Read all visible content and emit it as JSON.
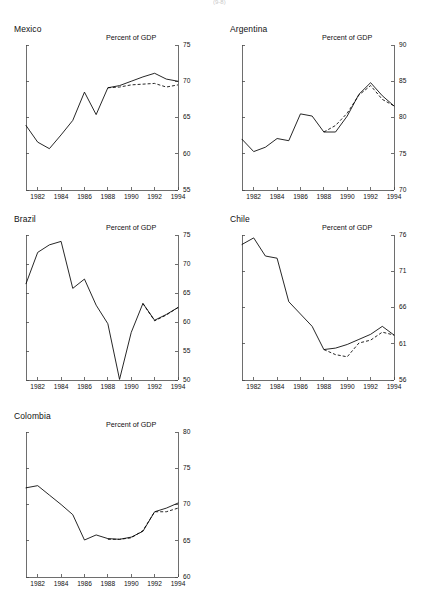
{
  "figure": {
    "top_artifact": "(9-8)",
    "units_label": "Percent of GDP",
    "background_color": "#ffffff",
    "line_color": "#000000",
    "axis_color": "#4a4a4a"
  },
  "panels": [
    {
      "key": "mexico",
      "title": "Mexico",
      "units_label": "Percent of GDP",
      "position": {
        "left": 6,
        "top": 24,
        "width": 204,
        "height": 186
      },
      "plot": {
        "left": 20,
        "top": 21,
        "right": 172,
        "bottom": 166
      }
    },
    {
      "key": "argentina",
      "title": "Argentina",
      "units_label": "Percent of GDP",
      "position": {
        "left": 222,
        "top": 24,
        "width": 204,
        "height": 186
      },
      "plot": {
        "left": 20,
        "top": 21,
        "right": 172,
        "bottom": 166
      }
    },
    {
      "key": "brazil",
      "title": "Brazil",
      "units_label": "Percent of GDP",
      "position": {
        "left": 6,
        "top": 214,
        "width": 204,
        "height": 186
      },
      "plot": {
        "left": 20,
        "top": 21,
        "right": 172,
        "bottom": 166
      }
    },
    {
      "key": "chile",
      "title": "Chile",
      "units_label": "Percent of GDP",
      "position": {
        "left": 222,
        "top": 214,
        "width": 204,
        "height": 186
      },
      "plot": {
        "left": 20,
        "top": 21,
        "right": 172,
        "bottom": 166
      }
    },
    {
      "key": "colombia",
      "title": "Colombia",
      "units_label": "Percent of GDP",
      "position": {
        "left": 6,
        "top": 411,
        "width": 204,
        "height": 186
      },
      "plot": {
        "left": 20,
        "top": 21,
        "right": 172,
        "bottom": 166
      }
    }
  ],
  "chart_data": [
    {
      "key": "mexico",
      "type": "line",
      "title": "Mexico",
      "xlabel": "",
      "ylabel": "Percent of GDP",
      "xlim": [
        1981,
        1994
      ],
      "ylim": [
        55,
        75
      ],
      "yticks": [
        55,
        60,
        65,
        70,
        75
      ],
      "xticks": [
        1982,
        1984,
        1986,
        1988,
        1990,
        1992,
        1994
      ],
      "grid": false,
      "legend": "none",
      "x": [
        1981,
        1982,
        1983,
        1984,
        1985,
        1986,
        1987,
        1988,
        1989,
        1990,
        1991,
        1992,
        1993,
        1994
      ],
      "series": [
        {
          "name": "solid",
          "style": "solid",
          "values": [
            63.9,
            61.6,
            60.7,
            62.6,
            64.6,
            68.5,
            65.4,
            69.1,
            69.4,
            70.0,
            70.6,
            71.1,
            70.3,
            70.0
          ]
        },
        {
          "name": "dashed",
          "style": "dashed",
          "values": [
            null,
            null,
            null,
            null,
            null,
            null,
            null,
            69.1,
            69.2,
            69.5,
            69.6,
            69.7,
            69.2,
            69.5
          ]
        }
      ]
    },
    {
      "key": "argentina",
      "type": "line",
      "title": "Argentina",
      "xlabel": "",
      "ylabel": "Percent of GDP",
      "xlim": [
        1981,
        1994
      ],
      "ylim": [
        70,
        90
      ],
      "yticks": [
        70,
        75,
        80,
        85,
        90
      ],
      "xticks": [
        1982,
        1984,
        1986,
        1988,
        1990,
        1992,
        1994
      ],
      "grid": false,
      "legend": "none",
      "x": [
        1981,
        1982,
        1983,
        1984,
        1985,
        1986,
        1987,
        1988,
        1989,
        1990,
        1991,
        1992,
        1993,
        1994
      ],
      "series": [
        {
          "name": "solid",
          "style": "solid",
          "values": [
            77.0,
            75.3,
            75.9,
            77.1,
            76.8,
            80.5,
            80.2,
            78.0,
            78.0,
            80.2,
            83.2,
            84.8,
            83.0,
            81.6
          ]
        },
        {
          "name": "dashed",
          "style": "dashed",
          "values": [
            null,
            null,
            null,
            null,
            null,
            null,
            null,
            78.0,
            78.9,
            80.6,
            83.1,
            84.4,
            82.5,
            81.6
          ]
        }
      ]
    },
    {
      "key": "brazil",
      "type": "line",
      "title": "Brazil",
      "xlabel": "",
      "ylabel": "Percent of GDP",
      "xlim": [
        1981,
        1994
      ],
      "ylim": [
        50,
        75
      ],
      "yticks": [
        50,
        55,
        60,
        65,
        70,
        75
      ],
      "xticks": [
        1982,
        1984,
        1986,
        1988,
        1990,
        1992,
        1994
      ],
      "grid": false,
      "legend": "none",
      "x": [
        1981,
        1982,
        1983,
        1984,
        1985,
        1986,
        1987,
        1988,
        1989,
        1990,
        1991,
        1992,
        1993,
        1994
      ],
      "series": [
        {
          "name": "solid",
          "style": "solid",
          "values": [
            66.6,
            72.0,
            73.3,
            73.9,
            65.8,
            67.4,
            62.9,
            59.7,
            50.1,
            58.2,
            63.2,
            60.3,
            61.3,
            62.5
          ]
        },
        {
          "name": "dashed",
          "style": "dashed",
          "values": [
            null,
            null,
            null,
            null,
            null,
            null,
            null,
            null,
            null,
            null,
            63.2,
            60.2,
            61.2,
            62.5
          ]
        }
      ]
    },
    {
      "key": "chile",
      "type": "line",
      "title": "Chile",
      "xlabel": "",
      "ylabel": "Percent of GDP",
      "xlim": [
        1981,
        1994
      ],
      "ylim": [
        56,
        76
      ],
      "yticks": [
        56,
        61,
        66,
        71,
        76
      ],
      "xticks": [
        1982,
        1984,
        1986,
        1988,
        1990,
        1992,
        1994
      ],
      "grid": false,
      "legend": "none",
      "x": [
        1981,
        1982,
        1983,
        1984,
        1985,
        1986,
        1987,
        1988,
        1989,
        1990,
        1991,
        1992,
        1993,
        1994
      ],
      "series": [
        {
          "name": "solid",
          "style": "solid",
          "values": [
            74.7,
            75.6,
            73.1,
            72.8,
            66.8,
            65.1,
            63.4,
            60.2,
            60.4,
            60.9,
            61.6,
            62.3,
            63.4,
            62.2
          ]
        },
        {
          "name": "dashed",
          "style": "dashed",
          "values": [
            null,
            null,
            null,
            null,
            null,
            null,
            null,
            60.2,
            59.5,
            59.2,
            61.1,
            61.5,
            62.6,
            62.2
          ]
        }
      ]
    },
    {
      "key": "colombia",
      "type": "line",
      "title": "Colombia",
      "xlabel": "",
      "ylabel": "Percent of GDP",
      "xlim": [
        1981,
        1994
      ],
      "ylim": [
        60,
        80
      ],
      "yticks": [
        60,
        65,
        70,
        75,
        80
      ],
      "xticks": [
        1982,
        1984,
        1986,
        1988,
        1990,
        1992,
        1994
      ],
      "grid": false,
      "legend": "none",
      "x": [
        1981,
        1982,
        1983,
        1984,
        1985,
        1986,
        1987,
        1988,
        1989,
        1990,
        1991,
        1992,
        1993,
        1994
      ],
      "series": [
        {
          "name": "solid",
          "style": "solid",
          "values": [
            72.3,
            72.6,
            71.3,
            70.0,
            68.6,
            65.1,
            65.8,
            65.3,
            65.2,
            65.5,
            66.3,
            69.0,
            69.5,
            70.2
          ]
        },
        {
          "name": "dashed",
          "style": "dashed",
          "values": [
            null,
            null,
            null,
            null,
            null,
            null,
            null,
            65.2,
            65.2,
            65.4,
            66.4,
            69.0,
            69.0,
            69.5
          ]
        }
      ]
    }
  ]
}
